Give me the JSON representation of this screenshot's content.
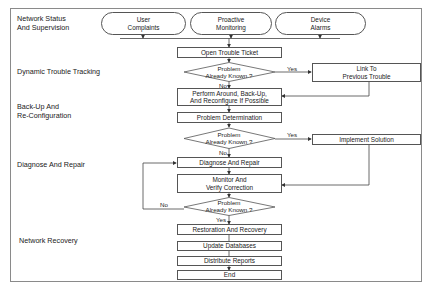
{
  "phases": {
    "network_status": "Network Status\nAnd Supervision",
    "dynamic_tracking": "Dynamic Trouble Tracking",
    "backup": "Back-Up And\nRe-Configuration",
    "diagnose": "Diagnose And Repair",
    "recovery": "Network Recovery"
  },
  "sources": {
    "user_complaints": "User\nComplaints",
    "proactive_monitoring": "Proactive\nMonitoring",
    "device_alarms": "Device\nAlarms"
  },
  "steps": {
    "open_ticket": "Open Trouble Ticket",
    "perform_around": "Perform Around, Back-Up,\nAnd Reconfigure If Possible",
    "problem_determination": "Problem Determination",
    "diagnose_repair": "Diagnose And Repair",
    "monitor_verify": "Monitor And\nVerify Correction",
    "restoration": "Restoration And Recovery",
    "update_db": "Update Databases",
    "distribute_reports": "Distribute Reports",
    "end": "End"
  },
  "side_steps": {
    "link_previous": "Link To\nPrevious Trouble",
    "implement_solution": "Implement Solution"
  },
  "decisions": {
    "d1": "Problem\nAlready Known ?",
    "d2": "Problem\nAlready Known ?",
    "d3": "Problem\nAlready Known ?"
  },
  "edge_labels": {
    "d1_yes": "Yes",
    "d1_no": "No",
    "d2_yes": "Yes",
    "d2_no": "No",
    "d3_no": "No",
    "d3_yes": "Yes"
  },
  "colors": {
    "line": "#444444",
    "frame": "#8a8a8a",
    "background": "#ffffff"
  }
}
